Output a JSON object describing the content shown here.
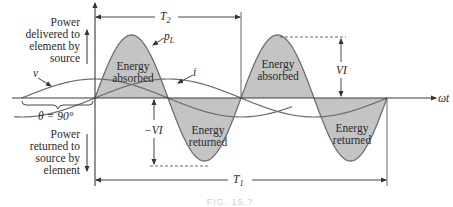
{
  "figure": {
    "caption": "FIG. 15.?",
    "axis_label": "ωt",
    "labels": {
      "power_delivered": [
        "Power",
        "delivered to",
        "element by",
        "source"
      ],
      "power_returned": [
        "Power",
        "returned to",
        "source by",
        "element"
      ],
      "theta": "θ = 90°",
      "v": "v",
      "i": "i",
      "pL": "p",
      "pL_sub": "L",
      "T2": "T",
      "T2_sub": "2",
      "T1": "T",
      "T1_sub": "1",
      "VI": "VI",
      "neg_VI": "−VI",
      "energy_absorbed_1": [
        "Energy",
        "absorbed"
      ],
      "energy_absorbed_2": [
        "Energy",
        "absorbed"
      ],
      "energy_returned_1": [
        "Energy",
        "returned"
      ],
      "energy_returned_2": [
        "Energy",
        "returned"
      ]
    },
    "colors": {
      "fill": "#c4c4c4",
      "curve": "#6e6e6e",
      "axis": "#3a3a3a",
      "text": "#2a2a2a"
    }
  }
}
